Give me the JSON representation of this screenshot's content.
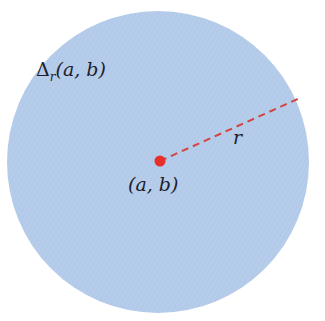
{
  "diagram": {
    "title_label": {
      "symbol": "Δ",
      "subscript": "r",
      "args": "(a, b)"
    },
    "center_label": "(a, b)",
    "radius_label": "r",
    "disk": {
      "cx": 158,
      "cy": 162,
      "r": 151,
      "fill": "#b5ccea"
    },
    "center_point": {
      "cx": 160,
      "cy": 161,
      "r": 5,
      "color": "#e8302a"
    },
    "radius_line": {
      "x1": 160,
      "y1": 161,
      "x2": 300,
      "y2": 98,
      "color": "#d2443e",
      "style": "dashed"
    }
  }
}
